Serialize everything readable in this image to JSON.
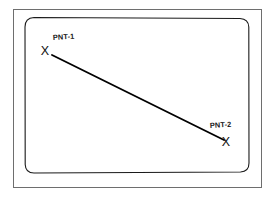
{
  "figure": {
    "background_color": "#ffffff",
    "line_color": "#000000",
    "frame_color": "#6e6e6e",
    "screen_outline_color": "#1a1a1a",
    "width": 275,
    "height": 198
  },
  "frame": {
    "name": "outer-rectangle-border",
    "x": 13,
    "y": 9,
    "width": 249,
    "height": 179
  },
  "screen": {
    "name": "crt-screen-outline",
    "x": 25,
    "y": 17,
    "width": 224,
    "height": 156,
    "corner_radius": 9
  },
  "points": [
    {
      "id": "pnt-1",
      "label": "PNT-1",
      "marker": "X",
      "marker_x": 45,
      "marker_y": 55,
      "label_x": 53,
      "label_y": 40
    },
    {
      "id": "pnt-2",
      "label": "PNT-2",
      "marker": "X",
      "marker_x": 226,
      "marker_y": 145,
      "label_x": 210,
      "label_y": 128
    }
  ],
  "connector": {
    "name": "pnt1-to-pnt2-line",
    "x1": 52,
    "y1": 55,
    "x2": 224,
    "y2": 140,
    "stroke_width": 1.9
  }
}
